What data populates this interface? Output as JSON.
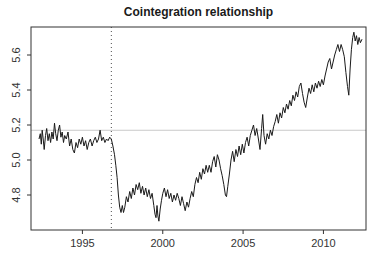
{
  "chart_data": {
    "type": "line",
    "title": "Cointegration relationship",
    "xlabel": "",
    "ylabel": "",
    "x_ticks": [
      "1995",
      "2000",
      "2005",
      "2010"
    ],
    "x_tick_values": [
      1995,
      2000,
      2005,
      2010
    ],
    "y_ticks": [
      "4.8",
      "5.0",
      "5.2",
      "5.4",
      "5.6"
    ],
    "y_tick_values": [
      4.8,
      5.0,
      5.2,
      5.4,
      5.6
    ],
    "xlim": [
      1991.8,
      2012.65
    ],
    "ylim": [
      4.6,
      5.76
    ],
    "grid": false,
    "legend_position": "none",
    "frame": true,
    "colors": {
      "line": "#1a1a1a",
      "axis": "#333333",
      "tick_label": "#333333",
      "title": "#1a1a1a",
      "h_reference": "#c9c9c9",
      "v_reference": "#4d4d4d"
    },
    "reference_lines": [
      {
        "orientation": "horizontal",
        "value": 5.17,
        "style": "solid",
        "color": "#c9c9c9"
      },
      {
        "orientation": "vertical",
        "value": 1996.8,
        "style": "dotted",
        "color": "#4d4d4d"
      }
    ],
    "series": [
      {
        "name": "cointegration relation",
        "color": "#1a1a1a",
        "points": [
          [
            1992.3,
            5.12
          ],
          [
            1992.38,
            5.15
          ],
          [
            1992.44,
            5.09
          ],
          [
            1992.5,
            5.17
          ],
          [
            1992.56,
            5.12
          ],
          [
            1992.62,
            5.06
          ],
          [
            1992.7,
            5.14
          ],
          [
            1992.78,
            5.18
          ],
          [
            1992.86,
            5.11
          ],
          [
            1992.94,
            5.15
          ],
          [
            1993.02,
            5.1
          ],
          [
            1993.1,
            5.16
          ],
          [
            1993.18,
            5.12
          ],
          [
            1993.26,
            5.21
          ],
          [
            1993.34,
            5.15
          ],
          [
            1993.42,
            5.11
          ],
          [
            1993.5,
            5.17
          ],
          [
            1993.58,
            5.2
          ],
          [
            1993.66,
            5.13
          ],
          [
            1993.74,
            5.16
          ],
          [
            1993.82,
            5.1
          ],
          [
            1993.9,
            5.14
          ],
          [
            1994.0,
            5.12
          ],
          [
            1994.1,
            5.16
          ],
          [
            1994.2,
            5.08
          ],
          [
            1994.3,
            5.12
          ],
          [
            1994.4,
            5.06
          ],
          [
            1994.5,
            5.04
          ],
          [
            1994.6,
            5.1
          ],
          [
            1994.7,
            5.07
          ],
          [
            1994.8,
            5.12
          ],
          [
            1994.9,
            5.09
          ],
          [
            1995.0,
            5.13
          ],
          [
            1995.1,
            5.08
          ],
          [
            1995.2,
            5.11
          ],
          [
            1995.3,
            5.06
          ],
          [
            1995.4,
            5.1
          ],
          [
            1995.5,
            5.12
          ],
          [
            1995.6,
            5.08
          ],
          [
            1995.7,
            5.11
          ],
          [
            1995.8,
            5.13
          ],
          [
            1995.9,
            5.1
          ],
          [
            1996.0,
            5.12
          ],
          [
            1996.1,
            5.17
          ],
          [
            1996.2,
            5.11
          ],
          [
            1996.3,
            5.13
          ],
          [
            1996.4,
            5.1
          ],
          [
            1996.5,
            5.12
          ],
          [
            1996.6,
            5.11
          ],
          [
            1996.7,
            5.13
          ],
          [
            1996.8,
            5.12
          ],
          [
            1996.9,
            5.08
          ],
          [
            1997.0,
            5.03
          ],
          [
            1997.08,
            4.97
          ],
          [
            1997.16,
            4.9
          ],
          [
            1997.24,
            4.8
          ],
          [
            1997.32,
            4.73
          ],
          [
            1997.4,
            4.7
          ],
          [
            1997.48,
            4.74
          ],
          [
            1997.56,
            4.7
          ],
          [
            1997.64,
            4.73
          ],
          [
            1997.74,
            4.79
          ],
          [
            1997.84,
            4.76
          ],
          [
            1997.94,
            4.82
          ],
          [
            1998.04,
            4.78
          ],
          [
            1998.14,
            4.84
          ],
          [
            1998.24,
            4.8
          ],
          [
            1998.34,
            4.86
          ],
          [
            1998.44,
            4.83
          ],
          [
            1998.54,
            4.87
          ],
          [
            1998.64,
            4.81
          ],
          [
            1998.74,
            4.85
          ],
          [
            1998.84,
            4.8
          ],
          [
            1998.94,
            4.84
          ],
          [
            1999.04,
            4.79
          ],
          [
            1999.14,
            4.83
          ],
          [
            1999.24,
            4.78
          ],
          [
            1999.34,
            4.81
          ],
          [
            1999.44,
            4.74
          ],
          [
            1999.52,
            4.69
          ],
          [
            1999.58,
            4.67
          ],
          [
            1999.64,
            4.74
          ],
          [
            1999.7,
            4.68
          ],
          [
            1999.76,
            4.65
          ],
          [
            1999.84,
            4.72
          ],
          [
            1999.92,
            4.77
          ],
          [
            2000.0,
            4.81
          ],
          [
            2000.1,
            4.84
          ],
          [
            2000.2,
            4.79
          ],
          [
            2000.3,
            4.83
          ],
          [
            2000.4,
            4.78
          ],
          [
            2000.5,
            4.81
          ],
          [
            2000.6,
            4.76
          ],
          [
            2000.7,
            4.8
          ],
          [
            2000.8,
            4.77
          ],
          [
            2000.9,
            4.81
          ],
          [
            2001.0,
            4.78
          ],
          [
            2001.1,
            4.74
          ],
          [
            2001.2,
            4.79
          ],
          [
            2001.3,
            4.75
          ],
          [
            2001.4,
            4.71
          ],
          [
            2001.5,
            4.76
          ],
          [
            2001.6,
            4.73
          ],
          [
            2001.7,
            4.78
          ],
          [
            2001.8,
            4.82
          ],
          [
            2001.9,
            4.79
          ],
          [
            2002.0,
            4.86
          ],
          [
            2002.1,
            4.9
          ],
          [
            2002.2,
            4.87
          ],
          [
            2002.3,
            4.93
          ],
          [
            2002.4,
            4.89
          ],
          [
            2002.5,
            4.95
          ],
          [
            2002.6,
            4.92
          ],
          [
            2002.7,
            4.97
          ],
          [
            2002.8,
            4.93
          ],
          [
            2002.9,
            4.97
          ],
          [
            2003.0,
            4.93
          ],
          [
            2003.1,
            4.99
          ],
          [
            2003.2,
            5.02
          ],
          [
            2003.3,
            4.96
          ],
          [
            2003.4,
            5.03
          ],
          [
            2003.5,
            5.0
          ],
          [
            2003.6,
            4.95
          ],
          [
            2003.7,
            4.91
          ],
          [
            2003.8,
            4.86
          ],
          [
            2003.9,
            4.8
          ],
          [
            2003.97,
            4.79
          ],
          [
            2004.05,
            4.85
          ],
          [
            2004.15,
            4.92
          ],
          [
            2004.25,
            5.0
          ],
          [
            2004.35,
            5.05
          ],
          [
            2004.45,
            4.99
          ],
          [
            2004.55,
            5.06
          ],
          [
            2004.65,
            5.02
          ],
          [
            2004.75,
            5.08
          ],
          [
            2004.85,
            5.03
          ],
          [
            2004.95,
            5.09
          ],
          [
            2005.05,
            5.04
          ],
          [
            2005.15,
            5.1
          ],
          [
            2005.25,
            5.13
          ],
          [
            2005.35,
            5.08
          ],
          [
            2005.45,
            5.14
          ],
          [
            2005.55,
            5.17
          ],
          [
            2005.65,
            5.2
          ],
          [
            2005.75,
            5.14
          ],
          [
            2005.85,
            5.18
          ],
          [
            2005.95,
            5.12
          ],
          [
            2006.05,
            5.06
          ],
          [
            2006.15,
            5.18
          ],
          [
            2006.22,
            5.26
          ],
          [
            2006.3,
            5.14
          ],
          [
            2006.4,
            5.09
          ],
          [
            2006.5,
            5.15
          ],
          [
            2006.6,
            5.12
          ],
          [
            2006.7,
            5.17
          ],
          [
            2006.8,
            5.14
          ],
          [
            2006.9,
            5.19
          ],
          [
            2007.0,
            5.22
          ],
          [
            2007.1,
            5.26
          ],
          [
            2007.2,
            5.21
          ],
          [
            2007.3,
            5.27
          ],
          [
            2007.4,
            5.24
          ],
          [
            2007.5,
            5.3
          ],
          [
            2007.6,
            5.27
          ],
          [
            2007.7,
            5.32
          ],
          [
            2007.8,
            5.29
          ],
          [
            2007.9,
            5.34
          ],
          [
            2008.0,
            5.31
          ],
          [
            2008.1,
            5.37
          ],
          [
            2008.2,
            5.34
          ],
          [
            2008.3,
            5.39
          ],
          [
            2008.4,
            5.36
          ],
          [
            2008.5,
            5.42
          ],
          [
            2008.6,
            5.44
          ],
          [
            2008.7,
            5.38
          ],
          [
            2008.8,
            5.33
          ],
          [
            2008.9,
            5.3
          ],
          [
            2009.0,
            5.36
          ],
          [
            2009.1,
            5.41
          ],
          [
            2009.2,
            5.38
          ],
          [
            2009.3,
            5.43
          ],
          [
            2009.4,
            5.39
          ],
          [
            2009.5,
            5.44
          ],
          [
            2009.6,
            5.41
          ],
          [
            2009.7,
            5.45
          ],
          [
            2009.8,
            5.42
          ],
          [
            2009.9,
            5.46
          ],
          [
            2010.0,
            5.43
          ],
          [
            2010.1,
            5.48
          ],
          [
            2010.2,
            5.52
          ],
          [
            2010.3,
            5.56
          ],
          [
            2010.4,
            5.58
          ],
          [
            2010.5,
            5.52
          ],
          [
            2010.6,
            5.56
          ],
          [
            2010.7,
            5.6
          ],
          [
            2010.8,
            5.63
          ],
          [
            2010.9,
            5.66
          ],
          [
            2011.0,
            5.62
          ],
          [
            2011.1,
            5.66
          ],
          [
            2011.2,
            5.63
          ],
          [
            2011.3,
            5.59
          ],
          [
            2011.4,
            5.5
          ],
          [
            2011.5,
            5.42
          ],
          [
            2011.58,
            5.37
          ],
          [
            2011.66,
            5.52
          ],
          [
            2011.74,
            5.63
          ],
          [
            2011.82,
            5.7
          ],
          [
            2011.9,
            5.73
          ],
          [
            2011.98,
            5.68
          ],
          [
            2012.06,
            5.71
          ],
          [
            2012.14,
            5.66
          ],
          [
            2012.22,
            5.7
          ],
          [
            2012.3,
            5.67
          ],
          [
            2012.4,
            5.69
          ]
        ]
      }
    ]
  }
}
